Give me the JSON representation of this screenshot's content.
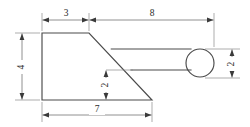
{
  "drawing": {
    "title": "Hammer-shaped part orthographic sketch",
    "background_color": "#ffffff",
    "outline_color": "#4a4a4a",
    "dimension_color": "#6b6b6b",
    "text_color": "#2b2b2b",
    "units": "",
    "dimensions": [
      {
        "id": "top-left-width",
        "label": "3",
        "orientation": "horizontal",
        "position": "top",
        "measures": "width of the flat top face of the head"
      },
      {
        "id": "top-right-length",
        "label": "8",
        "orientation": "horizontal",
        "position": "top",
        "measures": "length from the top face end to the right edge of the ball"
      },
      {
        "id": "left-height",
        "label": "4",
        "orientation": "vertical",
        "position": "left",
        "measures": "overall height of the head at the left edge"
      },
      {
        "id": "bottom-width",
        "label": "7",
        "orientation": "horizontal",
        "position": "bottom",
        "measures": "width of the bottom face of the head"
      },
      {
        "id": "middle-height",
        "label": "2",
        "orientation": "vertical",
        "position": "interior",
        "measures": "height from the bottom face to the underside of the handle"
      },
      {
        "id": "ball-diameter",
        "label": "2",
        "orientation": "vertical",
        "position": "right",
        "measures": "diameter of the round ball end"
      }
    ],
    "shapes": {
      "head": {
        "name": "head-body",
        "type": "quadrilateral",
        "points": "42,33 89,33 152,100 42,100"
      },
      "handle": {
        "name": "handle-shaft",
        "type": "tapered-bar",
        "top_edge": "111,49 190,49",
        "bottom_edge": "131,70 190,70"
      },
      "ball": {
        "name": "ball-end",
        "type": "circle",
        "cx": 200,
        "cy": 63,
        "r": 14
      }
    }
  }
}
